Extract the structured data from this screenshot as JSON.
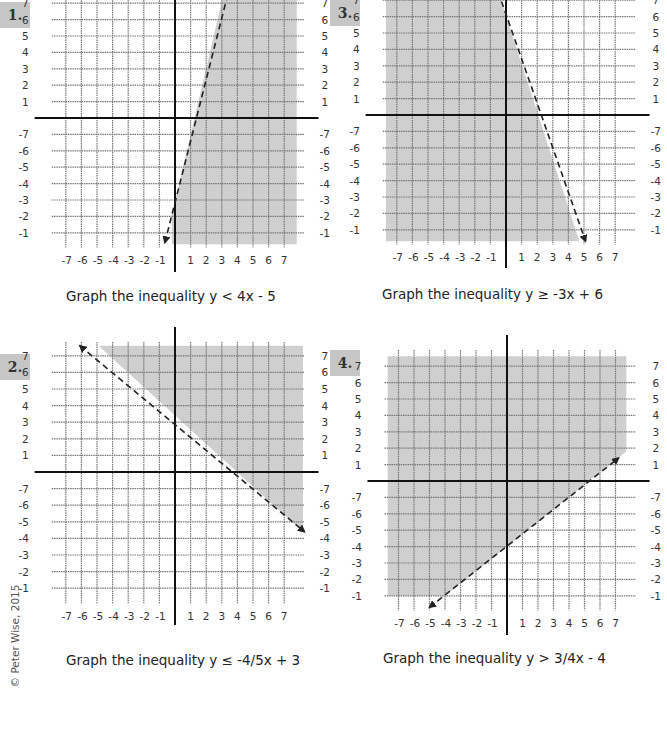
{
  "worksheet": {
    "copyright": "© Peter Wise, 2015",
    "problems": [
      {
        "number": "1.",
        "caption": "Graph the inequality y < 4x - 5"
      },
      {
        "number": "2.",
        "caption": "Graph the inequality y ≤ -4/5x + 3"
      },
      {
        "number": "3.",
        "caption": "Graph the inequality y ≥ -3x + 6"
      },
      {
        "number": "4.",
        "caption": "Graph the inequality y > 3/4x - 4"
      }
    ],
    "axis_ticks": {
      "x_negative": [
        "-7",
        "-6",
        "-5",
        "-4",
        "-3",
        "-2",
        "-1"
      ],
      "x_positive": [
        "1",
        "2",
        "3",
        "4",
        "5",
        "6",
        "7"
      ],
      "y_positive": [
        "7",
        "6",
        "5",
        "4",
        "3",
        "2",
        "1"
      ],
      "y_negative": [
        "-1",
        "-2",
        "-3",
        "-4",
        "-5",
        "-6",
        "-7"
      ]
    },
    "colors": {
      "shade": "#cfcfcf",
      "grid": "#777777",
      "axis": "#111111",
      "badge": "#c6c6c6"
    }
  },
  "chart_data": [
    {
      "type": "line",
      "title": "Graph the inequality y < 4x - 5",
      "boundary": {
        "slope": 4,
        "intercept": -5,
        "style": "dashed"
      },
      "shaded": "below/right",
      "xlim": [
        -7,
        7
      ],
      "ylim": [
        -7,
        7
      ],
      "grid": true
    },
    {
      "type": "line",
      "title": "Graph the inequality y ≤ -4/5x + 3",
      "boundary": {
        "slope": -0.8,
        "intercept": 3,
        "style": "dashed"
      },
      "shaded": "above",
      "xlim": [
        -7,
        7
      ],
      "ylim": [
        -7,
        7
      ],
      "grid": true
    },
    {
      "type": "line",
      "title": "Graph the inequality y ≥ -3x + 6",
      "boundary": {
        "slope": -3,
        "intercept": 6,
        "style": "dashed"
      },
      "shaded": "left/below",
      "xlim": [
        -7,
        7
      ],
      "ylim": [
        -7,
        7
      ],
      "grid": true
    },
    {
      "type": "line",
      "title": "Graph the inequality y > 3/4x - 4",
      "boundary": {
        "slope": 0.75,
        "intercept": -4,
        "style": "dashed"
      },
      "shaded": "above",
      "xlim": [
        -7,
        7
      ],
      "ylim": [
        -7,
        7
      ],
      "grid": true
    }
  ]
}
